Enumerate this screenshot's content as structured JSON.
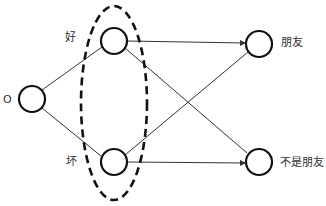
{
  "diagram": {
    "nodes": [
      {
        "id": "input",
        "label": "O"
      },
      {
        "id": "good",
        "label": "好"
      },
      {
        "id": "bad",
        "label": "坏"
      },
      {
        "id": "friend",
        "label": "朋友"
      },
      {
        "id": "not_friend",
        "label": "不是朋友"
      }
    ],
    "edges": [
      {
        "from": "input",
        "to": "good"
      },
      {
        "from": "input",
        "to": "bad"
      },
      {
        "from": "good",
        "to": "friend"
      },
      {
        "from": "good",
        "to": "not_friend"
      },
      {
        "from": "bad",
        "to": "friend"
      },
      {
        "from": "bad",
        "to": "not_friend"
      }
    ],
    "group": {
      "members": [
        "good",
        "bad"
      ],
      "style": "dashed-ellipse"
    }
  }
}
